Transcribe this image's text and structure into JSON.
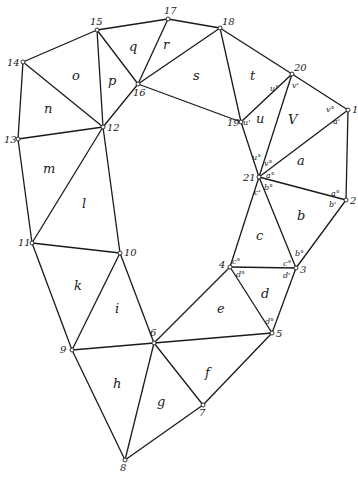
{
  "diagram": {
    "title": "",
    "vertices": [
      {
        "id": "1",
        "x": 348,
        "y": 110,
        "lx": 352,
        "ly": 113
      },
      {
        "id": "2",
        "x": 346,
        "y": 200,
        "lx": 350,
        "ly": 204
      },
      {
        "id": "3",
        "x": 296,
        "y": 268,
        "lx": 300,
        "ly": 273
      },
      {
        "id": "4",
        "x": 230,
        "y": 267,
        "lx": 219,
        "ly": 268
      },
      {
        "id": "5",
        "x": 272,
        "y": 333,
        "lx": 276,
        "ly": 337
      },
      {
        "id": "6",
        "x": 154,
        "y": 343,
        "lx": 150,
        "ly": 336
      },
      {
        "id": "7",
        "x": 203,
        "y": 405,
        "lx": 199,
        "ly": 416
      },
      {
        "id": "8",
        "x": 125,
        "y": 460,
        "lx": 120,
        "ly": 471
      },
      {
        "id": "9",
        "x": 72,
        "y": 350,
        "lx": 60,
        "ly": 353
      },
      {
        "id": "10",
        "x": 120,
        "y": 253,
        "lx": 124,
        "ly": 256
      },
      {
        "id": "11",
        "x": 32,
        "y": 243,
        "lx": 18,
        "ly": 246
      },
      {
        "id": "12",
        "x": 103,
        "y": 127,
        "lx": 107,
        "ly": 131
      },
      {
        "id": "13",
        "x": 18,
        "y": 139,
        "lx": 4,
        "ly": 143
      },
      {
        "id": "14",
        "x": 23,
        "y": 62,
        "lx": 7,
        "ly": 66
      },
      {
        "id": "15",
        "x": 97,
        "y": 30,
        "lx": 90,
        "ly": 25
      },
      {
        "id": "16",
        "x": 138,
        "y": 84,
        "lx": 133,
        "ly": 96
      },
      {
        "id": "17",
        "x": 168,
        "y": 19,
        "lx": 164,
        "ly": 14
      },
      {
        "id": "18",
        "x": 220,
        "y": 28,
        "lx": 222,
        "ly": 25
      },
      {
        "id": "19",
        "x": 241,
        "y": 122,
        "lx": 227,
        "ly": 126
      },
      {
        "id": "20",
        "x": 292,
        "y": 74,
        "lx": 294,
        "ly": 71
      },
      {
        "id": "21",
        "x": 259,
        "y": 177,
        "lx": 243,
        "ly": 181
      }
    ],
    "edges": [
      [
        "1",
        "20"
      ],
      [
        "20",
        "18"
      ],
      [
        "18",
        "17"
      ],
      [
        "17",
        "15"
      ],
      [
        "15",
        "14"
      ],
      [
        "14",
        "13"
      ],
      [
        "13",
        "11"
      ],
      [
        "11",
        "9"
      ],
      [
        "9",
        "8"
      ],
      [
        "8",
        "7"
      ],
      [
        "7",
        "5"
      ],
      [
        "5",
        "3"
      ],
      [
        "3",
        "2"
      ],
      [
        "2",
        "1"
      ],
      [
        "12",
        "16"
      ],
      [
        "16",
        "19"
      ],
      [
        "19",
        "21"
      ],
      [
        "21",
        "4"
      ],
      [
        "4",
        "6"
      ],
      [
        "6",
        "10"
      ],
      [
        "10",
        "12"
      ],
      [
        "1",
        "21"
      ],
      [
        "21",
        "2"
      ],
      [
        "21",
        "3"
      ],
      [
        "4",
        "3"
      ],
      [
        "4",
        "5"
      ],
      [
        "6",
        "5"
      ],
      [
        "6",
        "7"
      ],
      [
        "6",
        "8"
      ],
      [
        "6",
        "9"
      ],
      [
        "10",
        "9"
      ],
      [
        "10",
        "11"
      ],
      [
        "12",
        "11"
      ],
      [
        "12",
        "13"
      ],
      [
        "12",
        "14"
      ],
      [
        "12",
        "15"
      ],
      [
        "15",
        "16"
      ],
      [
        "16",
        "17"
      ],
      [
        "16",
        "18"
      ],
      [
        "18",
        "19"
      ],
      [
        "19",
        "20"
      ],
      [
        "20",
        "21"
      ]
    ],
    "faces": [
      {
        "id": "a",
        "x": 297,
        "y": 165
      },
      {
        "id": "b",
        "x": 297,
        "y": 220
      },
      {
        "id": "c",
        "x": 256,
        "y": 240
      },
      {
        "id": "d",
        "x": 261,
        "y": 298
      },
      {
        "id": "e",
        "x": 217,
        "y": 313
      },
      {
        "id": "f",
        "x": 205,
        "y": 377
      },
      {
        "id": "g",
        "x": 157,
        "y": 406
      },
      {
        "id": "h",
        "x": 113,
        "y": 388
      },
      {
        "id": "i",
        "x": 115,
        "y": 313
      },
      {
        "id": "k",
        "x": 74,
        "y": 290
      },
      {
        "id": "l",
        "x": 82,
        "y": 208
      },
      {
        "id": "m",
        "x": 43,
        "y": 173
      },
      {
        "id": "n",
        "x": 44,
        "y": 113
      },
      {
        "id": "o",
        "x": 72,
        "y": 80
      },
      {
        "id": "p",
        "x": 108,
        "y": 85
      },
      {
        "id": "q",
        "x": 129,
        "y": 51
      },
      {
        "id": "r",
        "x": 163,
        "y": 49
      },
      {
        "id": "s",
        "x": 193,
        "y": 80
      },
      {
        "id": "t",
        "x": 250,
        "y": 80
      },
      {
        "id": "u",
        "x": 256,
        "y": 123
      },
      {
        "id": "V",
        "x": 288,
        "y": 124
      }
    ],
    "angle_labels": [
      {
        "text": "u°",
        "x": 270,
        "y": 91
      },
      {
        "text": "v'",
        "x": 292,
        "y": 88
      },
      {
        "text": "u'",
        "x": 243,
        "y": 125
      },
      {
        "text": "v°",
        "x": 326,
        "y": 112
      },
      {
        "text": "a'",
        "x": 333,
        "y": 124
      },
      {
        "text": "u°",
        "x": 252,
        "y": 160
      },
      {
        "text": "v°",
        "x": 264,
        "y": 166
      },
      {
        "text": "a°",
        "x": 266,
        "y": 178
      },
      {
        "text": "b°",
        "x": 264,
        "y": 190
      },
      {
        "text": "c'",
        "x": 254,
        "y": 195
      },
      {
        "text": "a°",
        "x": 331,
        "y": 196
      },
      {
        "text": "b'",
        "x": 329,
        "y": 207
      },
      {
        "text": "c°",
        "x": 232,
        "y": 264
      },
      {
        "text": "d°",
        "x": 236,
        "y": 277
      },
      {
        "text": "c°",
        "x": 283,
        "y": 266
      },
      {
        "text": "b°",
        "x": 295,
        "y": 256
      },
      {
        "text": "d'",
        "x": 283,
        "y": 278
      },
      {
        "text": "d°",
        "x": 265,
        "y": 324
      }
    ]
  }
}
